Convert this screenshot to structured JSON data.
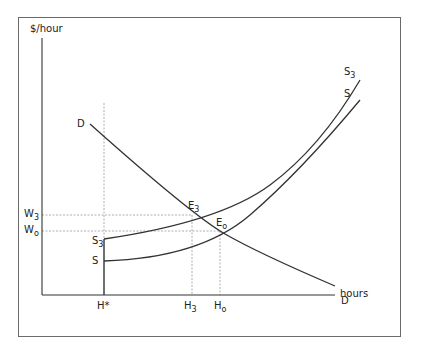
{
  "diagram": {
    "y_axis_label": "$/hour",
    "x_axis_label": "hours",
    "curves": {
      "demand": {
        "label_start": "D",
        "label_end": "D"
      },
      "supply": {
        "label_start": "S",
        "label_end": "S"
      },
      "supply3": {
        "label_start_main": "S",
        "label_start_sub": "3",
        "label_end_main": "S",
        "label_end_sub": "3"
      }
    },
    "equilibria": [
      {
        "main": "E",
        "sub": "3"
      },
      {
        "main": "E",
        "sub": "o"
      }
    ],
    "y_ticks": [
      {
        "main": "W",
        "sub": "3"
      },
      {
        "main": "W",
        "sub": "o"
      }
    ],
    "x_ticks": [
      {
        "main": "H*",
        "sub": ""
      },
      {
        "main": "H",
        "sub": "3"
      },
      {
        "main": "H",
        "sub": "o"
      }
    ],
    "colors": {
      "line": "#333333",
      "guide": "#888888",
      "frame": "#6a6a6a"
    }
  }
}
